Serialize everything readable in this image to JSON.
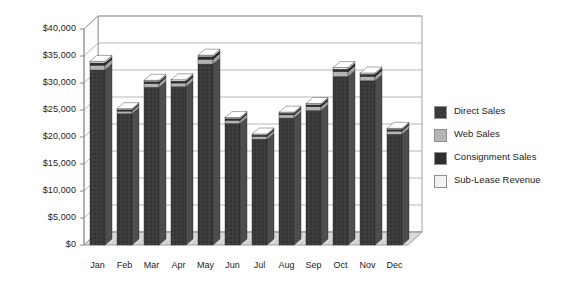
{
  "chart_data": {
    "type": "bar",
    "subtype": "stacked-3d-column",
    "title": "",
    "xlabel": "",
    "ylabel": "",
    "ylim": [
      0,
      40000
    ],
    "ytick_step": 5000,
    "grid": true,
    "legend_position": "right",
    "categories": [
      "Jan",
      "Feb",
      "Mar",
      "Apr",
      "May",
      "Jun",
      "Jul",
      "Aug",
      "Sep",
      "Oct",
      "Nov",
      "Dec"
    ],
    "ytick_labels": [
      "$0",
      "$5,000",
      "$10,000",
      "$15,000",
      "$20,000",
      "$25,000",
      "$30,000",
      "$35,000",
      "$40,000"
    ],
    "ytick_values": [
      0,
      5000,
      10000,
      15000,
      20000,
      25000,
      30000,
      35000,
      40000
    ],
    "series": [
      {
        "name": "Direct Sales",
        "color": "#3a3a3a",
        "values": [
          32400,
          24300,
          29200,
          29300,
          33500,
          22500,
          19600,
          23500,
          24900,
          31200,
          30400,
          20500
        ]
      },
      {
        "name": "Web Sales",
        "color": "#b4b4b4",
        "values": [
          900,
          500,
          700,
          700,
          900,
          600,
          500,
          600,
          700,
          900,
          800,
          600
        ]
      },
      {
        "name": "Consignment Sales",
        "color": "#2e2e2e",
        "values": [
          400,
          250,
          350,
          350,
          450,
          300,
          250,
          300,
          350,
          450,
          400,
          300
        ]
      },
      {
        "name": "Sub-Lease Revenue",
        "color": "#f0f0f0",
        "values": [
          300,
          200,
          250,
          250,
          300,
          200,
          200,
          200,
          250,
          300,
          250,
          200
        ]
      }
    ],
    "totals": [
      34000,
      25250,
      30500,
      30600,
      35150,
      23600,
      20550,
      24600,
      26200,
      32850,
      31850,
      21600
    ]
  },
  "legend": {
    "items": [
      {
        "label": "Direct Sales",
        "color": "#3a3a3a"
      },
      {
        "label": "Web Sales",
        "color": "#b4b4b4"
      },
      {
        "label": "Consignment Sales",
        "color": "#2e2e2e"
      },
      {
        "label": "Sub-Lease Revenue",
        "color": "#f2f2f2"
      }
    ]
  },
  "style": {
    "plot_bg": "#ffffff",
    "grid_color": "#9a9a9a",
    "axis_color": "#8c8c8c",
    "floor_color": "#d9d9d9",
    "wall_color": "#fbfbfb"
  }
}
